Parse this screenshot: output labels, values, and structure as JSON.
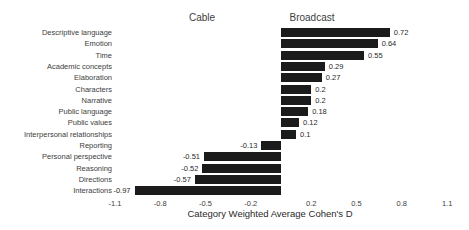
{
  "chart_data": {
    "type": "bar",
    "orientation": "horizontal",
    "group_labels": [
      "Cable",
      "Broadcast"
    ],
    "categories": [
      "Descriptive language",
      "Emotion",
      "Time",
      "Academic concepts",
      "Elaboration",
      "Characters",
      "Narrative",
      "Public language",
      "Public values",
      "Interpersonal relationships",
      "Reporting",
      "Personal perspective",
      "Reasoning",
      "Directions",
      "Interactions"
    ],
    "values": [
      0.72,
      0.64,
      0.55,
      0.29,
      0.27,
      0.2,
      0.2,
      0.18,
      0.12,
      0.1,
      -0.13,
      -0.51,
      -0.52,
      -0.57,
      -0.97
    ],
    "value_labels": [
      "0.72",
      "0.64",
      "0.55",
      "0.29",
      "0.27",
      "0.2",
      "0.2",
      "0.18",
      "0.12",
      "0.1",
      "-0.13",
      "-0.51",
      "-0.52",
      "-0.57",
      "-0.97"
    ],
    "x_ticks": [
      -1.1,
      -0.8,
      -0.5,
      -0.2,
      0.2,
      0.5,
      0.8,
      1.1
    ],
    "x_tick_labels": [
      "-1.1",
      "-0.8",
      "-0.5",
      "-0.2",
      "0.2",
      "0.5",
      "0.8",
      "1.1"
    ],
    "xlabel": "Category Weighted Average Cohen's D",
    "xlim": [
      -1.1,
      1.1
    ],
    "grid": false,
    "legend": false,
    "colors": {
      "bar": "#1b1b1b",
      "text": "#3d3d3d"
    }
  }
}
